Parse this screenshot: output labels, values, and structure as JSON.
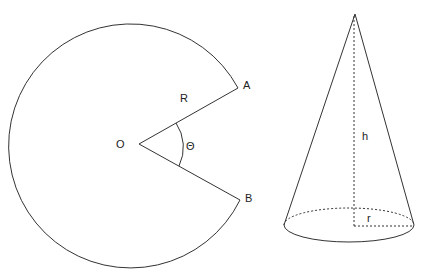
{
  "sector": {
    "center_label": "O",
    "point_a_label": "A",
    "point_b_label": "B",
    "radius_label": "R",
    "angle_label": "Θ"
  },
  "cone": {
    "height_label": "h",
    "radius_label": "r"
  },
  "colors": {
    "stroke": "#333333",
    "background": "#ffffff"
  }
}
